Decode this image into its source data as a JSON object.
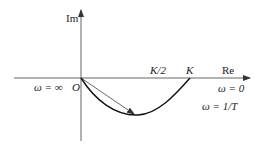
{
  "diagram": {
    "axes": {
      "imag_label": "Im",
      "real_label": "Re"
    },
    "origin_label": "O",
    "tick_labels": {
      "half_k": "K/2",
      "k": "K"
    },
    "annotations": {
      "omega_infinity": "ω = ∞",
      "omega_zero": "ω = 0",
      "omega_one_over_t": "ω = 1/T"
    },
    "colors": {
      "line": "#333333",
      "curve": "#111111"
    }
  }
}
